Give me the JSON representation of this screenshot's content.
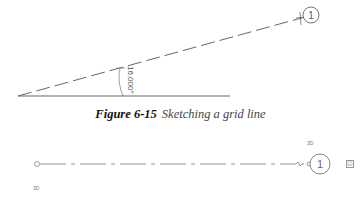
{
  "figure_top": {
    "angle_label": "16.000°",
    "bubble_label": "1"
  },
  "caption": {
    "number": "Figure 6-15",
    "text": "Sketching a grid line"
  },
  "figure_bottom": {
    "bubble_label": "1",
    "label_3d_top": "3D",
    "label_3d_bottom": "3D",
    "checkbox_glyph": "☑"
  }
}
